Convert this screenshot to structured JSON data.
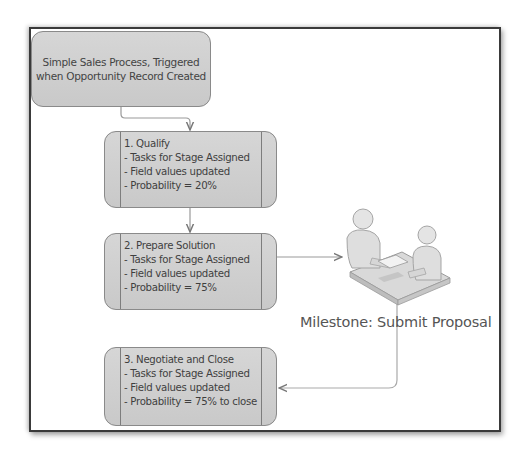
{
  "diagram": {
    "start": {
      "line1": "Simple Sales Process, Triggered",
      "line2": "when Opportunity Record Created"
    },
    "stages": [
      {
        "title": "1. Qualify",
        "items": [
          "- Tasks for Stage Assigned",
          "- Field values updated",
          "- Probability = 20%"
        ]
      },
      {
        "title": "2. Prepare Solution",
        "items": [
          "- Tasks for Stage Assigned",
          "- Field values updated",
          "- Probability = 75%"
        ]
      },
      {
        "title": "3. Negotiate and Close",
        "items": [
          "- Tasks for Stage Assigned",
          "- Field values updated",
          "- Probability = 75% to close"
        ]
      }
    ],
    "milestone": {
      "label": "Milestone: Submit Proposal",
      "icon": "meeting-people-icon"
    }
  },
  "colors": {
    "box_fill": "#cfcfcf",
    "box_border": "#8a8a8a",
    "connector": "#9a9a9a",
    "frame_border": "#3a3a3a",
    "text": "#444444"
  }
}
